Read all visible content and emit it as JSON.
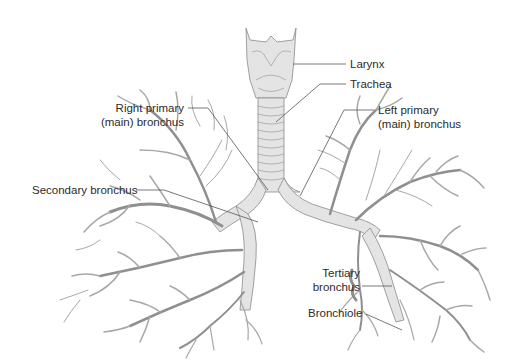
{
  "diagram": {
    "colors": {
      "structure_fill": "#e4e4e4",
      "structure_stroke": "#8a8a8a",
      "label_text": "#2b2b2b",
      "leader_line": "#555555",
      "background": "#ffffff"
    }
  },
  "labels": {
    "larynx": "Larynx",
    "trachea": "Trachea",
    "right_primary_line1": "Right primary",
    "right_primary_line2": "(main) bronchus",
    "left_primary_line1": "Left primary",
    "left_primary_line2": "(main) bronchus",
    "secondary_bronchus": "Secondary bronchus",
    "tertiary_line1": "Tertiary",
    "tertiary_line2": "bronchus",
    "bronchiole": "Bronchiole"
  }
}
